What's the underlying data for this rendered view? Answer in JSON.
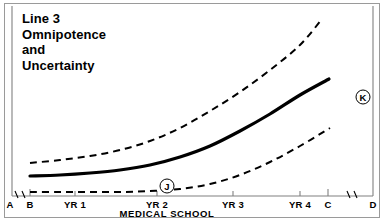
{
  "figure": {
    "title_lines": [
      "Line 3",
      "Omnipotence",
      "and",
      "Uncertainty"
    ],
    "axis_caption": "MEDICAL SCHOOL",
    "markers": [
      {
        "label": "J",
        "x": 167,
        "y": 186
      },
      {
        "label": "K",
        "x": 363,
        "y": 97
      }
    ],
    "colors": {
      "ink": "#000000",
      "frame": "#9a9a9a",
      "axis": "#808080",
      "background": "#ffffff"
    }
  },
  "chart_data": {
    "type": "line",
    "xlabel": "MEDICAL SCHOOL",
    "ylabel": "",
    "grid": false,
    "legend": "none",
    "x_tick_labels": [
      "A",
      "B",
      "YR 1",
      "YR 2",
      "YR 3",
      "YR 4",
      "C",
      "D"
    ],
    "x_tick_px": [
      10,
      30,
      75,
      157,
      233,
      300,
      328,
      373
    ],
    "axis_breaks": [
      {
        "between": [
          "A",
          "B"
        ],
        "x": 20
      },
      {
        "between": [
          "C",
          "D"
        ],
        "x": 352
      }
    ],
    "axis_px": {
      "x_left": 12,
      "x_right": 373,
      "y_baseline": 196,
      "y_top": 8
    },
    "series": [
      {
        "name": "upper-uncertainty-bound",
        "style": "dashed",
        "points": [
          [
            30,
            163
          ],
          [
            60,
            160
          ],
          [
            90,
            156
          ],
          [
            120,
            150
          ],
          [
            150,
            141
          ],
          [
            180,
            128
          ],
          [
            210,
            111
          ],
          [
            240,
            92
          ],
          [
            270,
            70
          ],
          [
            300,
            45
          ],
          [
            322,
            19
          ]
        ]
      },
      {
        "name": "expected-omnipotence",
        "style": "solid",
        "points": [
          [
            30,
            176
          ],
          [
            60,
            175
          ],
          [
            90,
            173
          ],
          [
            120,
            170
          ],
          [
            150,
            165
          ],
          [
            180,
            157
          ],
          [
            210,
            146
          ],
          [
            240,
            131
          ],
          [
            270,
            114
          ],
          [
            300,
            95
          ],
          [
            329,
            79
          ]
        ]
      },
      {
        "name": "lower-uncertainty-bound",
        "style": "dashed",
        "points": [
          [
            30,
            192
          ],
          [
            60,
            192
          ],
          [
            90,
            192
          ],
          [
            120,
            192
          ],
          [
            150,
            191
          ],
          [
            180,
            189
          ],
          [
            210,
            184
          ],
          [
            240,
            175
          ],
          [
            270,
            162
          ],
          [
            300,
            146
          ],
          [
            330,
            128
          ]
        ]
      }
    ]
  }
}
